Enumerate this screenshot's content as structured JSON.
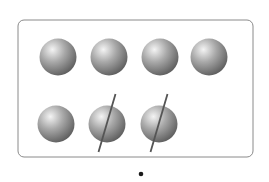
{
  "figure": {
    "frame": {
      "x": 18,
      "y": 20,
      "w": 235,
      "h": 137,
      "rx": 6,
      "stroke": "#8a8a8a"
    },
    "ball_color": {
      "highlight": "#f4f4f4",
      "mid": "#a9a9a9",
      "shadow": "#5c5c5c"
    },
    "ball_radius": 18.5,
    "balls": [
      {
        "cx": 58,
        "cy": 57,
        "crossed": false
      },
      {
        "cx": 109,
        "cy": 57,
        "crossed": false
      },
      {
        "cx": 160,
        "cy": 57,
        "crossed": false
      },
      {
        "cx": 209,
        "cy": 57,
        "crossed": false
      },
      {
        "cx": 56,
        "cy": 124,
        "crossed": false
      },
      {
        "cx": 107,
        "cy": 124,
        "crossed": true
      },
      {
        "cx": 159,
        "cy": 124,
        "crossed": true
      }
    ],
    "cross_line_color": "#555555",
    "total_count": 7,
    "crossed_count": 2,
    "remaining_count": 5,
    "dot": {
      "cx": 141,
      "cy": 174,
      "r": 2.3,
      "color": "#1a1a1a"
    }
  }
}
